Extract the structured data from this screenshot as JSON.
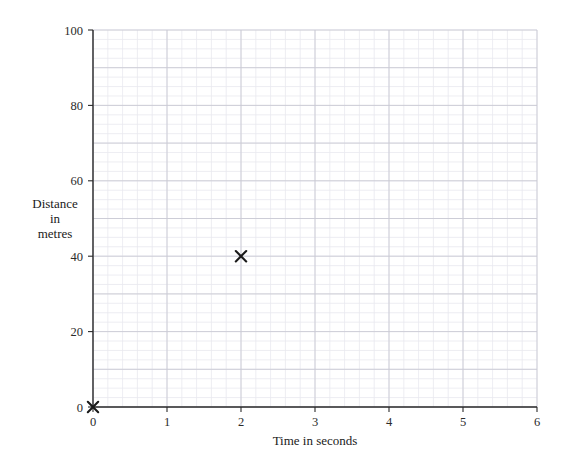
{
  "chart_data": {
    "type": "scatter",
    "title": "",
    "subtitle": "",
    "xlabel": "Time in seconds",
    "ylabel": "Distance in metres",
    "ylabel_lines": [
      "Distance",
      "in",
      "metres"
    ],
    "xlim": [
      0,
      6
    ],
    "ylim": [
      0,
      100
    ],
    "x_ticks": [
      0,
      1,
      2,
      3,
      4,
      5,
      6
    ],
    "x_tick_labels": [
      "0",
      "1",
      "2",
      "3",
      "4",
      "5",
      "6"
    ],
    "y_ticks": [
      0,
      20,
      40,
      60,
      80,
      100
    ],
    "y_tick_labels": [
      "0",
      "20",
      "40",
      "60",
      "80",
      "100"
    ],
    "grid": true,
    "grid_style": "graph-paper",
    "x_minor_step": 0.2,
    "x_major_step": 1,
    "y_minor_step": 2.5,
    "y_major_step": 10,
    "legend": false,
    "legend_position": "none",
    "marker": "x-cross",
    "series": [
      {
        "name": "Distance travelled",
        "points": [
          {
            "x": 0,
            "y": 0,
            "label": "(0, 0)"
          },
          {
            "x": 2,
            "y": 40,
            "label": "(2, 40)"
          }
        ]
      }
    ],
    "colors": {
      "marker": "#1a1a1a",
      "axis": "#2b2b2b",
      "grid_minor": "#e9e9ef",
      "grid_major": "#c9c9d4",
      "background": "#ffffff"
    }
  },
  "geometry": {
    "plot_left": 93,
    "plot_right": 537,
    "plot_top": 30,
    "plot_bottom": 407
  }
}
